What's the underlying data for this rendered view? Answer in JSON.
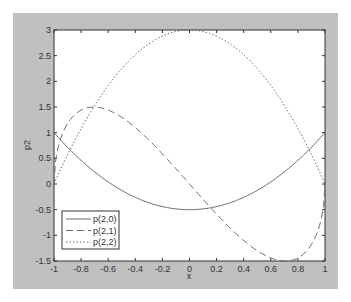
{
  "chart_data": {
    "type": "line",
    "title": "",
    "xlabel": "x",
    "ylabel": "p2",
    "xlim": [
      -1,
      1
    ],
    "ylim": [
      -1.5,
      3
    ],
    "xticks": [
      "-1",
      "-0.8",
      "-0.6",
      "-0.4",
      "-0.2",
      "0",
      "0.2",
      "0.4",
      "0.6",
      "0.8",
      "1"
    ],
    "yticks": [
      "-1.5",
      "-1",
      "-0.5",
      "0",
      "0.5",
      "1",
      "1.5",
      "2",
      "2.5",
      "3"
    ],
    "grid": false,
    "legend_position": "lower left",
    "series": [
      {
        "name": "p(2,0)",
        "style": "solid",
        "formula": "1.5*x^2-0.5",
        "x": [
          -1,
          -0.8,
          -0.6,
          -0.4,
          -0.2,
          0,
          0.2,
          0.4,
          0.6,
          0.8,
          1
        ],
        "values": [
          1,
          0.46,
          0.04,
          -0.26,
          -0.44,
          -0.5,
          -0.44,
          -0.26,
          0.04,
          0.46,
          1
        ]
      },
      {
        "name": "p(2,1)",
        "style": "dashed",
        "formula": "-3*x*sqrt(1-x^2)",
        "x": [
          -1,
          -0.8,
          -0.6,
          -0.4,
          -0.2,
          0,
          0.2,
          0.4,
          0.6,
          0.8,
          1
        ],
        "values": [
          0,
          1.44,
          1.44,
          1.1,
          0.59,
          0,
          -0.59,
          -1.1,
          -1.44,
          -1.44,
          0
        ]
      },
      {
        "name": "p(2,2)",
        "style": "dotted",
        "formula": "3*(1-x^2)",
        "x": [
          -1,
          -0.8,
          -0.6,
          -0.4,
          -0.2,
          0,
          0.2,
          0.4,
          0.6,
          0.8,
          1
        ],
        "values": [
          0,
          1.08,
          1.92,
          2.52,
          2.88,
          3,
          2.88,
          2.52,
          1.92,
          1.08,
          0
        ]
      }
    ]
  },
  "colors": {
    "frame": "#c0c0c0",
    "axes_bg": "#ffffff",
    "line": "#6a6a6a"
  }
}
